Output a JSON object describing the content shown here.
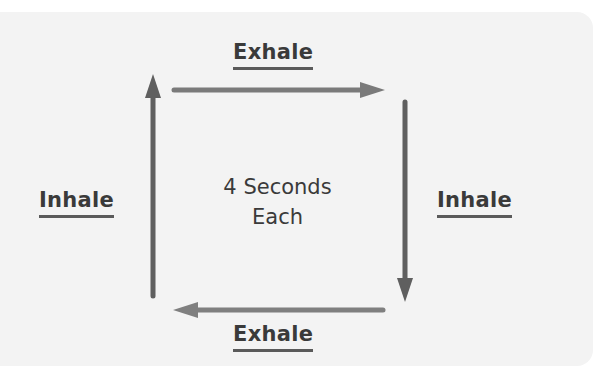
{
  "diagram": {
    "center_text": [
      "4 Seconds",
      "Each"
    ],
    "sides": [
      {
        "position": "top",
        "label": "Exhale",
        "direction": "right"
      },
      {
        "position": "right",
        "label": "Inhale",
        "direction": "down"
      },
      {
        "position": "bottom",
        "label": "Exhale",
        "direction": "left"
      },
      {
        "position": "left",
        "label": "Inhale",
        "direction": "up"
      }
    ],
    "colors": {
      "background": "#f3f3f3",
      "arrow": "#6b6b6b",
      "arrow_light": "#7d7d7d",
      "text": "#3a3a3a"
    }
  }
}
